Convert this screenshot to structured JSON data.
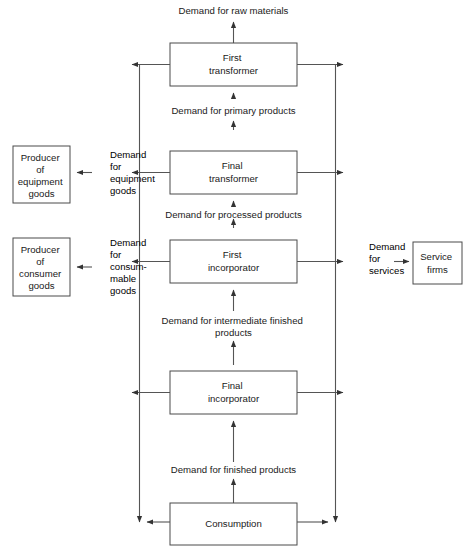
{
  "diagram": {
    "type": "flow-diagram",
    "colors": {
      "background": "#ffffff",
      "box_stroke": "#4a4a4a",
      "line_stroke": "#555555",
      "text": "#1a1a1a"
    },
    "nodes": [
      {
        "id": "first-transformer",
        "lines": [
          "First",
          "transformer"
        ]
      },
      {
        "id": "final-transformer",
        "lines": [
          "Final",
          "transformer"
        ]
      },
      {
        "id": "first-incorporator",
        "lines": [
          "First",
          "incorporator"
        ]
      },
      {
        "id": "final-incorporator",
        "lines": [
          "Final",
          "incorporator"
        ]
      },
      {
        "id": "consumption",
        "lines": [
          "Consumption"
        ]
      },
      {
        "id": "producer-equipment-goods",
        "lines": [
          "Producer",
          "of",
          "equipment",
          "goods"
        ]
      },
      {
        "id": "producer-consumer-goods",
        "lines": [
          "Producer",
          "of",
          "consumer",
          "goods"
        ]
      },
      {
        "id": "service-firms",
        "lines": [
          "Service",
          "firms"
        ]
      }
    ],
    "edge_labels": [
      {
        "id": "demand-raw-materials",
        "lines": [
          "Demand for raw materials"
        ]
      },
      {
        "id": "demand-primary-products",
        "lines": [
          "Demand for primary products"
        ]
      },
      {
        "id": "demand-equipment-goods",
        "lines": [
          "Demand",
          "for",
          "equipment",
          "goods"
        ]
      },
      {
        "id": "demand-processed-products",
        "lines": [
          "Demand for processed products"
        ]
      },
      {
        "id": "demand-consummable-goods",
        "lines": [
          "Demand",
          "for",
          "consum-",
          "mable",
          "goods"
        ]
      },
      {
        "id": "demand-services",
        "lines": [
          "Demand",
          "for",
          "services"
        ]
      },
      {
        "id": "demand-intermediate-finished-products",
        "lines": [
          "Demand for intermediate finished",
          "products"
        ]
      },
      {
        "id": "demand-finished-products",
        "lines": [
          "Demand for finished products"
        ]
      }
    ]
  }
}
